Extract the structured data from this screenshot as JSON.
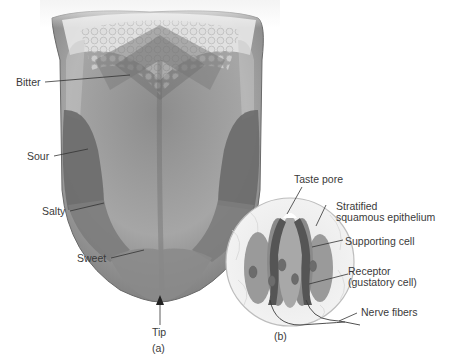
{
  "figure_a": {
    "caption": "(a)",
    "labels": {
      "bitter": "Bitter",
      "sour": "Sour",
      "salty": "Salty",
      "sweet": "Sweet",
      "tip": "Tip"
    }
  },
  "figure_b": {
    "caption": "(b)",
    "labels": {
      "taste_pore": "Taste pore",
      "epithelium_line1": "Stratified",
      "epithelium_line2": "squamous epithelium",
      "supporting_cell": "Supporting cell",
      "receptor_line1": "Receptor",
      "receptor_line2": "(gustatory cell)",
      "nerve_fibers": "Nerve fibers"
    }
  },
  "colors": {
    "tongue_base": "#9a9a9a",
    "tongue_light": "#b8b8b8",
    "region_dark": "#6e6e6e",
    "region_mid": "#858585",
    "text": "#3a3a3a",
    "leader": "#333333"
  }
}
